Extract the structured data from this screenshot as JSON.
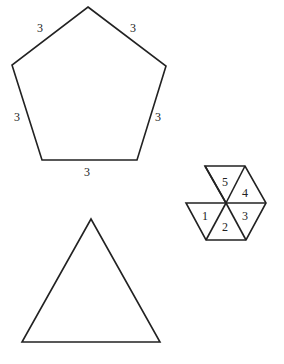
{
  "pentagon": {
    "side_labels": [
      "3",
      "3",
      "3",
      "3",
      "3"
    ]
  },
  "hexagon_net": {
    "triangle_labels": [
      "1",
      "2",
      "3",
      "4",
      "5"
    ]
  },
  "triangle": {}
}
